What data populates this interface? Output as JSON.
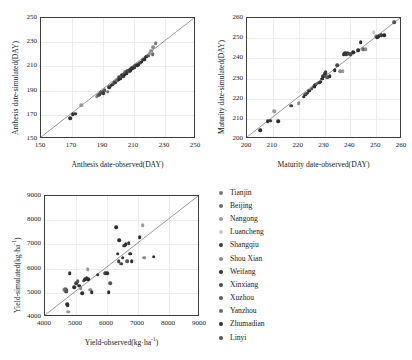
{
  "figure": {
    "background": "#ffffff",
    "axis_color": "#3d3d3d",
    "grid_color": "#ececec",
    "refline_color": "#8c8c8c"
  },
  "legend": {
    "position": "right",
    "items": [
      {
        "label": "Tianjin",
        "color": "#7a7a7a"
      },
      {
        "label": "Beijing",
        "color": "#6e6e6e"
      },
      {
        "label": "Nangong",
        "color": "#9a9a9a"
      },
      {
        "label": "Luancheng",
        "color": "#c9c9c9"
      },
      {
        "label": "Shangqiu",
        "color": "#3c3c3c"
      },
      {
        "label": "Shou Xian",
        "color": "#8a8a8a"
      },
      {
        "label": "Weifang",
        "color": "#2e2e2e"
      },
      {
        "label": "Xinxiang",
        "color": "#4a4a4a"
      },
      {
        "label": "Xuzhou",
        "color": "#5c5c5c"
      },
      {
        "label": "Yanzhou",
        "color": "#6a6a6a"
      },
      {
        "label": "Zhumadian",
        "color": "#303030"
      },
      {
        "label": "Linyi",
        "color": "#555555"
      }
    ]
  },
  "chart_data": [
    {
      "id": "anthesis",
      "type": "scatter",
      "title": "",
      "xlabel": "Anthesis date-observed(DAY)",
      "ylabel": "Anthesis date-simulated(DAY)",
      "xlim": [
        150,
        250
      ],
      "ylim": [
        150,
        250
      ],
      "xticks": [
        150,
        170,
        190,
        210,
        230,
        250
      ],
      "yticks": [
        150,
        170,
        190,
        210,
        230,
        250
      ],
      "grid": true,
      "reference_line": {
        "type": "1:1",
        "from": [
          150,
          150
        ],
        "to": [
          250,
          250
        ]
      },
      "points": [
        {
          "x": 169,
          "y": 167,
          "c": "#303030"
        },
        {
          "x": 170.5,
          "y": 170.5,
          "c": "#2e2e2e"
        },
        {
          "x": 172,
          "y": 171,
          "c": "#3c3c3c"
        },
        {
          "x": 176,
          "y": 178,
          "c": "#9a9a9a"
        },
        {
          "x": 186,
          "y": 185,
          "c": "#8a8a8a"
        },
        {
          "x": 187,
          "y": 186,
          "c": "#6e6e6e"
        },
        {
          "x": 188,
          "y": 187,
          "c": "#4a4a4a"
        },
        {
          "x": 188.5,
          "y": 188.5,
          "c": "#555555"
        },
        {
          "x": 190,
          "y": 188,
          "c": "#3c3c3c"
        },
        {
          "x": 190.5,
          "y": 190,
          "c": "#2e2e2e"
        },
        {
          "x": 191,
          "y": 190.5,
          "c": "#5c5c5c"
        },
        {
          "x": 193,
          "y": 189,
          "c": "#6a6a6a"
        },
        {
          "x": 194,
          "y": 193,
          "c": "#303030"
        },
        {
          "x": 195,
          "y": 194,
          "c": "#4a4a4a"
        },
        {
          "x": 196,
          "y": 195,
          "c": "#2e2e2e"
        },
        {
          "x": 197,
          "y": 196,
          "c": "#555555"
        },
        {
          "x": 198,
          "y": 197,
          "c": "#3c3c3c"
        },
        {
          "x": 199,
          "y": 198.5,
          "c": "#6e6e6e"
        },
        {
          "x": 200,
          "y": 199,
          "c": "#2e2e2e"
        },
        {
          "x": 200.5,
          "y": 201,
          "c": "#4a4a4a"
        },
        {
          "x": 201,
          "y": 200,
          "c": "#303030"
        },
        {
          "x": 202,
          "y": 201.5,
          "c": "#5c5c5c"
        },
        {
          "x": 202.5,
          "y": 203,
          "c": "#2e2e2e"
        },
        {
          "x": 203,
          "y": 202,
          "c": "#3c3c3c"
        },
        {
          "x": 203.5,
          "y": 204,
          "c": "#555555"
        },
        {
          "x": 204,
          "y": 203.5,
          "c": "#2e2e2e"
        },
        {
          "x": 204.5,
          "y": 205,
          "c": "#6a6a6a"
        },
        {
          "x": 205,
          "y": 204,
          "c": "#303030"
        },
        {
          "x": 205.5,
          "y": 206,
          "c": "#4a4a4a"
        },
        {
          "x": 206,
          "y": 205.5,
          "c": "#2e2e2e"
        },
        {
          "x": 206.5,
          "y": 206.5,
          "c": "#3c3c3c"
        },
        {
          "x": 207,
          "y": 206,
          "c": "#555555"
        },
        {
          "x": 207.5,
          "y": 207,
          "c": "#2e2e2e"
        },
        {
          "x": 208,
          "y": 207.5,
          "c": "#303030"
        },
        {
          "x": 208.5,
          "y": 208,
          "c": "#4a4a4a"
        },
        {
          "x": 209,
          "y": 208.5,
          "c": "#2e2e2e"
        },
        {
          "x": 210,
          "y": 209,
          "c": "#3c3c3c"
        },
        {
          "x": 210.5,
          "y": 210,
          "c": "#2e2e2e"
        },
        {
          "x": 211,
          "y": 210.5,
          "c": "#555555"
        },
        {
          "x": 212,
          "y": 211,
          "c": "#303030"
        },
        {
          "x": 213,
          "y": 212,
          "c": "#2e2e2e"
        },
        {
          "x": 214,
          "y": 213,
          "c": "#4a4a4a"
        },
        {
          "x": 215,
          "y": 214,
          "c": "#2e2e2e"
        },
        {
          "x": 216,
          "y": 215.5,
          "c": "#3c3c3c"
        },
        {
          "x": 217,
          "y": 216,
          "c": "#303030"
        },
        {
          "x": 218,
          "y": 218,
          "c": "#2e2e2e"
        },
        {
          "x": 219,
          "y": 219,
          "c": "#555555"
        },
        {
          "x": 220,
          "y": 221,
          "c": "#9a9a9a"
        },
        {
          "x": 221,
          "y": 223,
          "c": "#8a8a8a"
        },
        {
          "x": 222,
          "y": 220,
          "c": "#6a6a6a"
        },
        {
          "x": 222.5,
          "y": 226,
          "c": "#8a8a8a"
        },
        {
          "x": 224,
          "y": 229,
          "c": "#7a7a7a"
        }
      ]
    },
    {
      "id": "maturity",
      "type": "scatter",
      "title": "",
      "xlabel": "Maturity date-observed(DAY)",
      "ylabel": "Maturity date-simulated(DAY)",
      "xlim": [
        200,
        260
      ],
      "ylim": [
        200,
        260
      ],
      "xticks": [
        200,
        210,
        220,
        230,
        240,
        250,
        260
      ],
      "yticks": [
        200,
        210,
        220,
        230,
        240,
        250,
        260
      ],
      "grid": true,
      "reference_line": {
        "type": "1:1",
        "from": [
          200,
          200
        ],
        "to": [
          260,
          260
        ]
      },
      "points": [
        {
          "x": 205,
          "y": 204.5,
          "c": "#303030"
        },
        {
          "x": 208,
          "y": 208.8,
          "c": "#2e2e2e"
        },
        {
          "x": 209,
          "y": 209,
          "c": "#3c3c3c"
        },
        {
          "x": 212,
          "y": 208.8,
          "c": "#2e2e2e"
        },
        {
          "x": 210.5,
          "y": 213.8,
          "c": "#9a9a9a"
        },
        {
          "x": 217,
          "y": 216.5,
          "c": "#4a4a4a"
        },
        {
          "x": 220,
          "y": 217.8,
          "c": "#8a8a8a"
        },
        {
          "x": 222,
          "y": 221,
          "c": "#303030"
        },
        {
          "x": 222.5,
          "y": 222,
          "c": "#2e2e2e"
        },
        {
          "x": 223,
          "y": 222.5,
          "c": "#555555"
        },
        {
          "x": 223.5,
          "y": 223,
          "c": "#3c3c3c"
        },
        {
          "x": 224,
          "y": 224,
          "c": "#2e2e2e"
        },
        {
          "x": 225,
          "y": 225,
          "c": "#4a4a4a"
        },
        {
          "x": 226,
          "y": 226,
          "c": "#303030"
        },
        {
          "x": 226.5,
          "y": 227,
          "c": "#2e2e2e"
        },
        {
          "x": 227,
          "y": 227.5,
          "c": "#6a6a6a"
        },
        {
          "x": 228,
          "y": 228,
          "c": "#3c3c3c"
        },
        {
          "x": 228.5,
          "y": 228.5,
          "c": "#2e2e2e"
        },
        {
          "x": 229,
          "y": 230,
          "c": "#303030"
        },
        {
          "x": 229.5,
          "y": 231,
          "c": "#2e2e2e"
        },
        {
          "x": 230,
          "y": 231.5,
          "c": "#4a4a4a"
        },
        {
          "x": 230.2,
          "y": 232.5,
          "c": "#2e2e2e"
        },
        {
          "x": 230.5,
          "y": 233,
          "c": "#3c3c3c"
        },
        {
          "x": 231,
          "y": 230.5,
          "c": "#555555"
        },
        {
          "x": 232,
          "y": 231,
          "c": "#303030"
        },
        {
          "x": 234,
          "y": 234,
          "c": "#2e2e2e"
        },
        {
          "x": 235,
          "y": 236.5,
          "c": "#4a4a4a"
        },
        {
          "x": 236,
          "y": 233.5,
          "c": "#8a8a8a"
        },
        {
          "x": 237,
          "y": 233.5,
          "c": "#9a9a9a"
        },
        {
          "x": 237.5,
          "y": 242,
          "c": "#2e2e2e"
        },
        {
          "x": 238,
          "y": 242.5,
          "c": "#303030"
        },
        {
          "x": 238.5,
          "y": 242,
          "c": "#3c3c3c"
        },
        {
          "x": 239,
          "y": 242.8,
          "c": "#2e2e2e"
        },
        {
          "x": 239.5,
          "y": 242.2,
          "c": "#555555"
        },
        {
          "x": 240,
          "y": 242,
          "c": "#4a4a4a"
        },
        {
          "x": 241,
          "y": 243,
          "c": "#2e2e2e"
        },
        {
          "x": 243,
          "y": 244,
          "c": "#303030"
        },
        {
          "x": 244,
          "y": 248,
          "c": "#2e2e2e"
        },
        {
          "x": 245,
          "y": 244.5,
          "c": "#6a6a6a"
        },
        {
          "x": 246,
          "y": 244.5,
          "c": "#8a8a8a"
        },
        {
          "x": 249,
          "y": 253,
          "c": "#c9c9c9"
        },
        {
          "x": 250,
          "y": 251,
          "c": "#9a9a9a"
        },
        {
          "x": 250.5,
          "y": 250.5,
          "c": "#2e2e2e"
        },
        {
          "x": 251,
          "y": 251,
          "c": "#303030"
        },
        {
          "x": 252,
          "y": 251.5,
          "c": "#3c3c3c"
        },
        {
          "x": 253,
          "y": 251.5,
          "c": "#2e2e2e"
        },
        {
          "x": 257,
          "y": 258,
          "c": "#555555"
        }
      ]
    },
    {
      "id": "yield",
      "type": "scatter",
      "title": "",
      "xlabel": "Yield-observed(kg·ha⁻¹)",
      "ylabel": "Yield-simulated(kg·ha⁻¹)",
      "xlim": [
        4000,
        9000
      ],
      "ylim": [
        4000,
        9000
      ],
      "xticks": [
        4000,
        5000,
        6000,
        7000,
        8000,
        9000
      ],
      "yticks": [
        4000,
        5000,
        6000,
        7000,
        8000,
        9000
      ],
      "grid": true,
      "reference_line": {
        "type": "1:1",
        "from": [
          4000,
          4000
        ],
        "to": [
          9000,
          9000
        ]
      },
      "points": [
        {
          "x": 4620,
          "y": 5120,
          "c": "#9a9a9a"
        },
        {
          "x": 4650,
          "y": 5080,
          "c": "#8a8a8a"
        },
        {
          "x": 4660,
          "y": 5150,
          "c": "#6a6a6a"
        },
        {
          "x": 4680,
          "y": 5050,
          "c": "#4a4a4a"
        },
        {
          "x": 4700,
          "y": 5100,
          "c": "#555555"
        },
        {
          "x": 4720,
          "y": 4530,
          "c": "#303030"
        },
        {
          "x": 4730,
          "y": 4480,
          "c": "#2e2e2e"
        },
        {
          "x": 4750,
          "y": 4220,
          "c": "#9a9a9a"
        },
        {
          "x": 4800,
          "y": 5820,
          "c": "#303030"
        },
        {
          "x": 4950,
          "y": 5230,
          "c": "#2e2e2e"
        },
        {
          "x": 5000,
          "y": 5400,
          "c": "#3c3c3c"
        },
        {
          "x": 5050,
          "y": 5480,
          "c": "#555555"
        },
        {
          "x": 5100,
          "y": 5300,
          "c": "#2e2e2e"
        },
        {
          "x": 5150,
          "y": 5200,
          "c": "#8a8a8a"
        },
        {
          "x": 5200,
          "y": 4980,
          "c": "#303030"
        },
        {
          "x": 5250,
          "y": 5500,
          "c": "#4a4a4a"
        },
        {
          "x": 5300,
          "y": 5560,
          "c": "#2e2e2e"
        },
        {
          "x": 5350,
          "y": 5620,
          "c": "#3c3c3c"
        },
        {
          "x": 5380,
          "y": 5980,
          "c": "#9a9a9a"
        },
        {
          "x": 5400,
          "y": 5560,
          "c": "#2e2e2e"
        },
        {
          "x": 5450,
          "y": 5130,
          "c": "#8a8a8a"
        },
        {
          "x": 5500,
          "y": 5020,
          "c": "#303030"
        },
        {
          "x": 5700,
          "y": 5740,
          "c": "#2e2e2e"
        },
        {
          "x": 5950,
          "y": 5800,
          "c": "#4a4a4a"
        },
        {
          "x": 6000,
          "y": 5800,
          "c": "#303030"
        },
        {
          "x": 6050,
          "y": 5020,
          "c": "#2e2e2e"
        },
        {
          "x": 6100,
          "y": 5400,
          "c": "#555555"
        },
        {
          "x": 6300,
          "y": 7700,
          "c": "#2e2e2e"
        },
        {
          "x": 6350,
          "y": 6620,
          "c": "#303030"
        },
        {
          "x": 6380,
          "y": 6300,
          "c": "#3c3c3c"
        },
        {
          "x": 6400,
          "y": 7180,
          "c": "#2e2e2e"
        },
        {
          "x": 6450,
          "y": 6200,
          "c": "#4a4a4a"
        },
        {
          "x": 6500,
          "y": 6450,
          "c": "#2e2e2e"
        },
        {
          "x": 6550,
          "y": 6950,
          "c": "#303030"
        },
        {
          "x": 6600,
          "y": 7000,
          "c": "#2e2e2e"
        },
        {
          "x": 6650,
          "y": 6300,
          "c": "#555555"
        },
        {
          "x": 6700,
          "y": 7050,
          "c": "#3c3c3c"
        },
        {
          "x": 6750,
          "y": 6620,
          "c": "#2e2e2e"
        },
        {
          "x": 6800,
          "y": 6300,
          "c": "#303030"
        },
        {
          "x": 7050,
          "y": 7300,
          "c": "#2e2e2e"
        },
        {
          "x": 7150,
          "y": 7800,
          "c": "#9a9a9a"
        },
        {
          "x": 7200,
          "y": 6450,
          "c": "#8a8a8a"
        },
        {
          "x": 7500,
          "y": 6500,
          "c": "#303030"
        }
      ]
    }
  ]
}
